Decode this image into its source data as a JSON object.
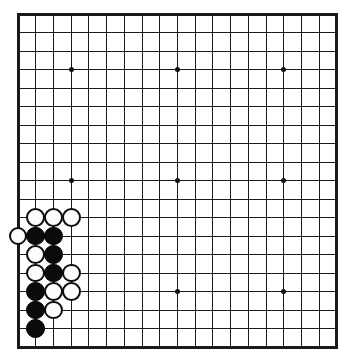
{
  "board": {
    "kind": "go-board",
    "size": 19,
    "title": "Go board diagram",
    "geometry": {
      "origin_x": 18,
      "origin_y": 14,
      "step_x": 17.72,
      "step_y": 18.5,
      "stone_radius": 9.4
    },
    "colors": {
      "line": "#1a1a1a",
      "background": "#ffffff",
      "black_stone": "#0b0b0b",
      "white_stone": "#fdfdfd",
      "white_stone_border": "#0d0d0d",
      "star_point": "#111111"
    },
    "star_points": [
      {
        "col": 3,
        "row": 3
      },
      {
        "col": 9,
        "row": 3
      },
      {
        "col": 15,
        "row": 3
      },
      {
        "col": 3,
        "row": 9
      },
      {
        "col": 9,
        "row": 9
      },
      {
        "col": 15,
        "row": 9
      },
      {
        "col": 3,
        "row": 15
      },
      {
        "col": 9,
        "row": 15
      },
      {
        "col": 15,
        "row": 15
      }
    ],
    "stones": [
      {
        "col": 1,
        "row": 11,
        "color": "white"
      },
      {
        "col": 2,
        "row": 11,
        "color": "white"
      },
      {
        "col": 3,
        "row": 11,
        "color": "white"
      },
      {
        "col": 0,
        "row": 12,
        "color": "white"
      },
      {
        "col": 1,
        "row": 12,
        "color": "black"
      },
      {
        "col": 2,
        "row": 12,
        "color": "black"
      },
      {
        "col": 1,
        "row": 13,
        "color": "white"
      },
      {
        "col": 2,
        "row": 13,
        "color": "black"
      },
      {
        "col": 1,
        "row": 14,
        "color": "white"
      },
      {
        "col": 2,
        "row": 14,
        "color": "black"
      },
      {
        "col": 3,
        "row": 14,
        "color": "white"
      },
      {
        "col": 1,
        "row": 15,
        "color": "black"
      },
      {
        "col": 2,
        "row": 15,
        "color": "white"
      },
      {
        "col": 3,
        "row": 15,
        "color": "white"
      },
      {
        "col": 1,
        "row": 16,
        "color": "black"
      },
      {
        "col": 2,
        "row": 16,
        "color": "white"
      },
      {
        "col": 1,
        "row": 17,
        "color": "black"
      }
    ],
    "counts": {
      "black_stones": 7,
      "white_stones": 10,
      "total_stones": 17
    }
  }
}
